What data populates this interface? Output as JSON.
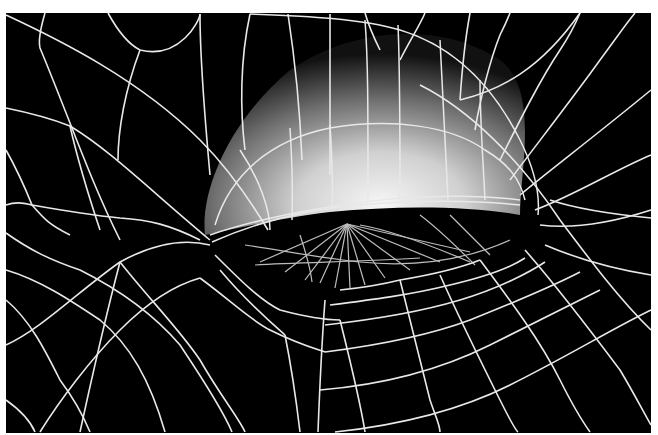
{
  "figure": {
    "background": "#ffffff",
    "panel": {
      "x": 6,
      "y": 13,
      "w": 645,
      "h": 420,
      "fill": "#000000"
    },
    "line_color": "#e8e8e8",
    "inner_line_color": "#bdbdbd",
    "eyelid_shading": {
      "highlight": "#f4f4f4",
      "mid": "#9a9a9a",
      "dark": "#1a1a1a"
    }
  },
  "mesh": {
    "eyelid_outline": "M205,235 C200,190 230,120 290,70 C350,28 440,20 500,60 C540,90 520,170 520,215 C470,206 400,205 330,212 C280,218 240,228 205,235 Z",
    "eye_opening": "M220,247 C300,222 380,205 455,212 C495,215 515,222 520,230 C470,252 440,262 400,272 C340,282 270,278 232,262 Z",
    "outer_lines": [
      "M6,15 C60,40 140,80 200,140 C230,170 250,200 268,230",
      "M45,13 C40,30 38,40 40,48 C70,120 90,180 120,240",
      "M108,13 C120,35 130,45 140,50 C180,60 200,20 200,14",
      "M140,50 C125,90 118,130 118,160",
      "M6,108 C40,115 60,122 70,126 C110,150 150,190 210,240",
      "M6,150 C20,175 28,195 32,205 C45,220 50,225 70,235",
      "M6,205 C20,200 30,205 32,205",
      "M32,205 C60,210 90,215 120,218 C150,220 170,225 200,240",
      "M70,126 C80,170 90,200 100,230",
      "M200,14 C200,60 205,120 210,175",
      "M250,14 C240,60 240,110 245,150",
      "M288,14 C295,60 300,110 302,160",
      "M330,14 C330,60 330,120 330,175",
      "M6,345 C40,330 80,290 120,262 C160,240 190,240 210,245",
      "M6,270 C40,280 70,300 100,320 C130,345 150,380 165,432",
      "M6,300 C30,320 45,350 60,380 C75,400 85,420 90,432",
      "M40,432 C60,400 90,360 120,330 C150,300 175,285 200,278",
      "M6,400 C20,410 30,420 35,432",
      "M6,233 C30,250 50,260 80,270 C110,285 150,310 180,345 C210,390 225,415 232,432",
      "M120,262 C150,300 180,330 200,360 C220,395 240,420 245,432",
      "M120,262 C110,300 100,340 80,432",
      "M200,278 C230,300 250,320 270,330 C300,345 320,350 325,352",
      "M215,255 C240,280 260,300 280,310 C310,318 330,320 340,320",
      "M220,270 C245,300 268,320 285,335",
      "M285,335 C290,360 295,390 300,432",
      "M325,300 C322,340 320,380 318,432",
      "M340,320 C350,360 360,400 365,432",
      "M340,290 C360,288 380,285 400,280 C430,275 460,268 480,260",
      "M330,305 C370,300 410,295 450,285 C480,278 510,268 525,258",
      "M325,325 C370,320 420,312 460,300 C500,288 530,272 545,262",
      "M325,352 C380,345 430,335 470,320 C520,300 555,285 580,272",
      "M320,390 C380,385 440,370 490,345 C540,320 580,300 600,290",
      "M335,432 C400,425 460,410 510,385 C570,355 610,330 651,310",
      "M400,280 C410,320 420,360 430,400 C435,415 440,425 440,432",
      "M440,275 C460,320 480,360 500,400 C510,420 515,430 518,432",
      "M480,260 C510,300 540,340 560,380 C575,410 585,425 590,432",
      "M525,250 C560,290 590,330 620,370 C635,395 645,415 651,425",
      "M540,225 C580,230 620,220 651,210",
      "M545,245 C580,260 620,270 651,275",
      "M535,210 C575,195 615,170 651,155",
      "M520,195 C550,170 590,140 651,90",
      "M510,180 C540,140 575,95 600,60 C615,40 625,25 635,13",
      "M500,160 C520,120 540,80 560,50 C570,35 575,25 580,13",
      "M475,130 C480,100 490,60 500,35 C505,25 508,18 510,13",
      "M460,100 C462,70 465,40 470,13",
      "M400,60 C410,40 420,25 425,13",
      "M380,50 C375,40 370,30 365,13",
      "M460,100 C500,90 540,70 580,13",
      "M420,85 C470,110 520,160 560,220 C590,260 620,300 651,330",
      "M550,200 C580,210 620,215 651,218"
    ],
    "lid_lines": [
      "M250,14 C300,16 360,18 400,30 C450,45 490,80 520,140 C535,170 540,195 538,215",
      "M215,225 C230,175 270,140 330,128 C390,118 450,125 485,150 C510,165 520,180 525,200",
      "M212,242 C250,225 300,210 360,205 C420,200 470,200 520,205",
      "M210,235 C260,218 330,205 400,198 C450,195 490,196 520,200",
      "M240,150 C260,180 270,210 270,230",
      "M290,128 C292,160 293,190 292,220",
      "M330,125 C332,155 333,185 332,210",
      "M365,20 C368,60 368,100 368,205",
      "M398,25 C400,70 400,120 400,200",
      "M440,40 C442,80 445,130 448,200",
      "M480,80 C480,120 483,160 485,200"
    ],
    "inner_lines": [
      "M347,224 L260,262",
      "M347,224 L285,272",
      "M347,224 L305,280",
      "M347,224 L320,283",
      "M347,224 L335,288",
      "M347,224 L350,288",
      "M347,224 L365,285",
      "M347,224 L385,278",
      "M347,224 L410,270",
      "M347,224 L440,262",
      "M347,224 L470,252",
      "M245,245 C280,250 320,258 360,262 C420,268 470,258 510,240",
      "M255,265 C300,262 360,262 420,258",
      "M360,225 C390,230 430,245 470,262",
      "M420,215 C440,230 460,250 475,265",
      "M450,215 C465,230 480,245 490,255",
      "M300,235 C305,250 310,265 312,282"
    ]
  }
}
